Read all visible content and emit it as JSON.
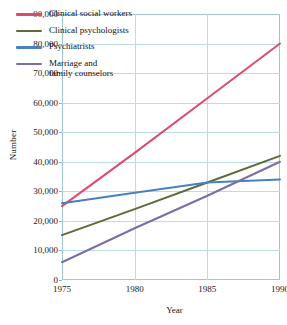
{
  "chart_data": {
    "type": "line",
    "title": "",
    "xlabel": "Year",
    "ylabel": "Number",
    "xlim": [
      1975,
      1990
    ],
    "ylim": [
      0,
      90000
    ],
    "grid": true,
    "legend_position": "top-left-inside",
    "x_ticks": [
      "1975",
      "1980",
      "1985",
      "1990"
    ],
    "x_tick_values": [
      1975,
      1980,
      1985,
      1990
    ],
    "y_ticks": [
      "0",
      "10,000",
      "20,000",
      "30,000",
      "40,000",
      "50,000",
      "60,000",
      "70,000",
      "80,000",
      "90,000"
    ],
    "y_tick_values": [
      0,
      10000,
      20000,
      30000,
      40000,
      50000,
      60000,
      70000,
      80000,
      90000
    ],
    "x": [
      1975,
      1980,
      1985,
      1990
    ],
    "series": [
      {
        "name": "Clinical social workers",
        "color": "#DE4A6E",
        "values": [
          25000,
          43000,
          61500,
          80000
        ]
      },
      {
        "name": "Clinical psychologists",
        "color": "#5C6B38",
        "values": [
          15200,
          24000,
          33000,
          42000
        ]
      },
      {
        "name": "Psychiatrists",
        "color": "#4880C2",
        "values": [
          26000,
          29500,
          33000,
          34000
        ]
      },
      {
        "name": "Marriage and\nfamily counselors",
        "color": "#7C6DA8",
        "values": [
          6000,
          17500,
          28500,
          40000
        ]
      }
    ]
  },
  "legend": {
    "items": [
      {
        "label": "Clinical social workers",
        "color": "#DE4A6E"
      },
      {
        "label": "Clinical psychologists",
        "color": "#5C6B38"
      },
      {
        "label": "Psychiatrists",
        "color": "#4880C2"
      },
      {
        "label": "Marriage and\nfamily counselors",
        "color": "#7C6DA8"
      }
    ]
  },
  "axes": {
    "y_title": "Number",
    "x_title": "Year"
  }
}
